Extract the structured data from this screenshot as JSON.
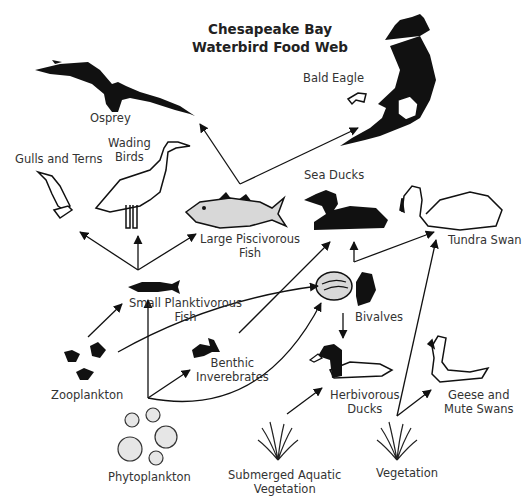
{
  "title": {
    "line1": "Chesapeake Bay",
    "line2": "Waterbird Food Web"
  },
  "nodes": {
    "osprey": {
      "label": "Osprey",
      "icon": "osprey-silhouette"
    },
    "bald_eagle": {
      "label": "Bald Eagle",
      "icon": "bald-eagle-illustration"
    },
    "gulls_terns": {
      "label": "Gulls and Terns",
      "icon": "gull-outline"
    },
    "wading_birds": {
      "label1": "Wading",
      "label2": "Birds",
      "icon": "heron-outline"
    },
    "large_fish": {
      "label1": "Large Piscivorous",
      "label2": "Fish",
      "icon": "striped-bass-illustration"
    },
    "sea_ducks": {
      "label": "Sea Ducks",
      "icon": "sea-duck-silhouette"
    },
    "tundra_swan": {
      "label": "Tundra Swan",
      "icon": "swan-outline"
    },
    "small_fish": {
      "label1": "Small Planktivorous",
      "label2": "Fish",
      "icon": "small-fish-silhouette"
    },
    "bivalves": {
      "label": "Bivalves",
      "icon": "clam-mussel-illustration"
    },
    "zooplankton": {
      "label": "Zooplankton",
      "icon": "copepod-silhouettes"
    },
    "benthic": {
      "label1": "Benthic",
      "label2": "Inverebrates",
      "icon": "worm-silhouette"
    },
    "herbivorous_ducks": {
      "label1": "Herbivorous",
      "label2": "Ducks",
      "icon": "scaup-illustration"
    },
    "geese_swans": {
      "label1": "Geese and",
      "label2": "Mute Swans",
      "icon": "goose-outline"
    },
    "phytoplankton": {
      "label": "Phytoplankton",
      "icon": "cell-circles"
    },
    "sav": {
      "label1": "Submerged Aquatic",
      "label2": "Vegetation",
      "icon": "grass-tuft"
    },
    "vegetation": {
      "label": "Vegetation",
      "icon": "grass-tuft"
    }
  },
  "edges": [
    {
      "from": "Small Planktivorous Fish",
      "to": "Gulls and Terns"
    },
    {
      "from": "Small Planktivorous Fish",
      "to": "Wading Birds"
    },
    {
      "from": "Small Planktivorous Fish",
      "to": "Large Piscivorous Fish"
    },
    {
      "from": "Large Piscivorous Fish",
      "to": "Osprey"
    },
    {
      "from": "Large Piscivorous Fish",
      "to": "Bald Eagle"
    },
    {
      "from": "Zooplankton",
      "to": "Small Planktivorous Fish"
    },
    {
      "from": "Zooplankton",
      "to": "Bivalves"
    },
    {
      "from": "Phytoplankton",
      "to": "Small Planktivorous Fish"
    },
    {
      "from": "Phytoplankton",
      "to": "Benthic Inverebrates"
    },
    {
      "from": "Phytoplankton",
      "to": "Bivalves"
    },
    {
      "from": "Benthic Inverebrates",
      "to": "Sea Ducks"
    },
    {
      "from": "Bivalves",
      "to": "Sea Ducks"
    },
    {
      "from": "Bivalves",
      "to": "Tundra Swan"
    },
    {
      "from": "Bivalves",
      "to": "Herbivorous Ducks"
    },
    {
      "from": "Submerged Aquatic Vegetation",
      "to": "Herbivorous Ducks"
    },
    {
      "from": "Vegetation",
      "to": "Tundra Swan"
    },
    {
      "from": "Vegetation",
      "to": "Geese and Mute Swans"
    }
  ],
  "colors": {
    "ink": "#111111",
    "fill_gray": "#d8d8d8",
    "text": "#333333",
    "background": "#ffffff"
  }
}
